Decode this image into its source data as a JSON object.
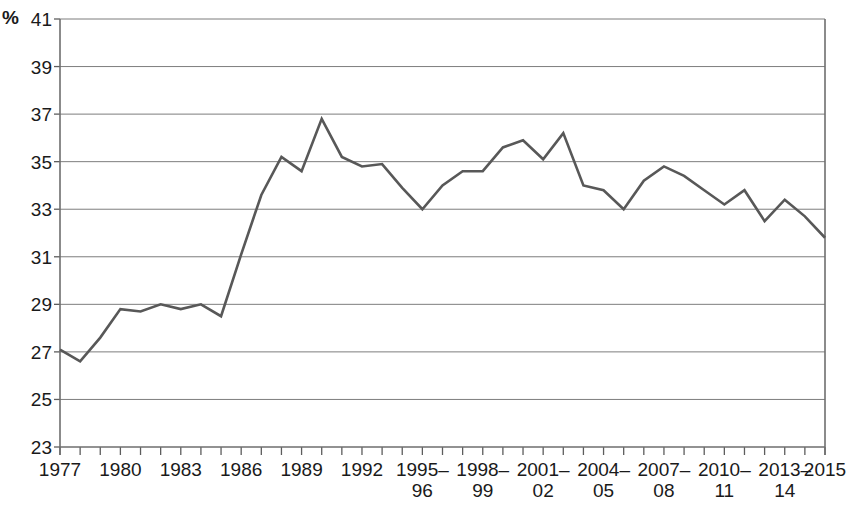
{
  "chart_data": {
    "type": "line",
    "title": "",
    "subtitle": "",
    "xlabel": "",
    "ylabel": "%",
    "y_unit_label": "%",
    "ylim": [
      23,
      41
    ],
    "y_ticks": [
      23,
      25,
      27,
      29,
      31,
      33,
      35,
      37,
      39,
      41
    ],
    "y_tick_labels": [
      "23",
      "25",
      "27",
      "29",
      "31",
      "33",
      "35",
      "37",
      "39",
      "41"
    ],
    "grid": "horizontal",
    "legend": "none",
    "line_color": "#585858",
    "x": [
      1977,
      1978,
      1979,
      1980,
      1981,
      1982,
      1983,
      1984,
      1985,
      1986,
      1987,
      1988,
      1989,
      1990,
      1991,
      1992,
      1993,
      1994,
      1995,
      1996,
      1997,
      1998,
      1999,
      2000,
      2001,
      2002,
      2003,
      2004,
      2005,
      2006,
      2007,
      2008,
      2009,
      2010,
      2011,
      2012,
      2013,
      2014,
      2015
    ],
    "x_tick_labels": [
      "1977",
      "",
      "",
      "1980",
      "",
      "",
      "1983",
      "",
      "",
      "1986",
      "",
      "",
      "1989",
      "",
      "",
      "1992",
      "",
      "",
      "1995–\n96",
      "",
      "",
      "1998–\n99",
      "",
      "",
      "2001–\n02",
      "",
      "",
      "2004–\n05",
      "",
      "",
      "2007–\n08",
      "",
      "",
      "2010–\n11",
      "",
      "",
      "2013–\n14",
      "",
      "2015"
    ],
    "x_major_labels": [
      {
        "x": 1977,
        "label": "1977"
      },
      {
        "x": 1980,
        "label": "1980"
      },
      {
        "x": 1983,
        "label": "1983"
      },
      {
        "x": 1986,
        "label": "1986"
      },
      {
        "x": 1989,
        "label": "1989"
      },
      {
        "x": 1992,
        "label": "1992"
      },
      {
        "x": 1995,
        "label": "1995–\n96"
      },
      {
        "x": 1998,
        "label": "1998–\n99"
      },
      {
        "x": 2001,
        "label": "2001–\n02"
      },
      {
        "x": 2004,
        "label": "2004–\n05"
      },
      {
        "x": 2007,
        "label": "2007–\n08"
      },
      {
        "x": 2010,
        "label": "2010–\n11"
      },
      {
        "x": 2013,
        "label": "2013–\n14"
      },
      {
        "x": 2015,
        "label": "2015"
      }
    ],
    "values": [
      27.1,
      26.6,
      27.6,
      28.8,
      28.7,
      29.0,
      28.8,
      29.0,
      28.5,
      31.1,
      33.6,
      35.2,
      34.6,
      36.8,
      35.2,
      34.8,
      34.9,
      33.9,
      33.0,
      34.0,
      34.6,
      34.6,
      35.6,
      35.9,
      35.1,
      36.2,
      34.0,
      33.8,
      33.0,
      34.2,
      34.8,
      34.4,
      33.8,
      33.2,
      33.8,
      32.5,
      33.4,
      32.7,
      31.8
    ],
    "series": [
      {
        "name": "",
        "values": [
          27.1,
          26.6,
          27.6,
          28.8,
          28.7,
          29.0,
          28.8,
          29.0,
          28.5,
          31.1,
          33.6,
          35.2,
          34.6,
          36.8,
          35.2,
          34.8,
          34.9,
          33.9,
          33.0,
          34.0,
          34.6,
          34.6,
          35.6,
          35.9,
          35.1,
          36.2,
          34.0,
          33.8,
          33.0,
          34.2,
          34.8,
          34.4,
          33.8,
          33.2,
          33.8,
          32.5,
          33.4,
          32.7,
          31.8
        ]
      }
    ]
  }
}
